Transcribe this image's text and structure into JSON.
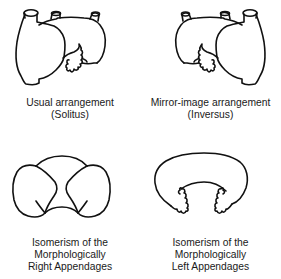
{
  "figure": {
    "panels": [
      {
        "id": "solitus",
        "caption_line1": "Usual arrangement",
        "caption_line2": "(Solitus)"
      },
      {
        "id": "inversus",
        "caption_line1": "Mirror-image arrangement",
        "caption_line2": "(Inversus)"
      },
      {
        "id": "right-isomerism",
        "caption_line1": "Isomerism of the",
        "caption_line2": "Morphologically",
        "caption_line3": "Right Appendages"
      },
      {
        "id": "left-isomerism",
        "caption_line1": "Isomerism of the",
        "caption_line2": "Morphologically",
        "caption_line3": "Left Appendages"
      }
    ]
  }
}
